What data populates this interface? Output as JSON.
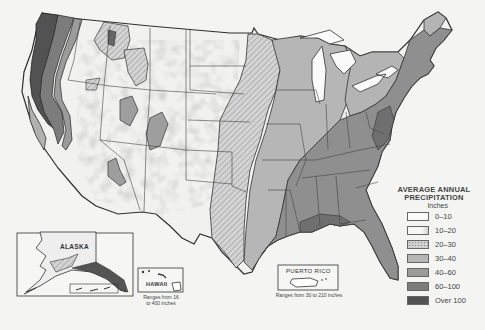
{
  "map": {
    "subject": "Average annual precipitation, United States",
    "legend": {
      "title_line1": "AVERAGE ANNUAL",
      "title_line2": "PRECIPITATION",
      "unit": "Inches",
      "items": [
        {
          "label": "0–10",
          "color": "#fbfbfb",
          "pattern": "plain"
        },
        {
          "label": "10–20",
          "color": "#f0f0f0",
          "pattern": "light-speckle"
        },
        {
          "label": "20–30",
          "color": "#c9c9c9",
          "pattern": "stipple"
        },
        {
          "label": "30–40",
          "color": "#b6b6b6",
          "pattern": "plain"
        },
        {
          "label": "40–60",
          "color": "#9b9b9b",
          "pattern": "plain"
        },
        {
          "label": "60–100",
          "color": "#7c7c7c",
          "pattern": "plain"
        },
        {
          "label": "Over 100",
          "color": "#525252",
          "pattern": "plain"
        }
      ]
    },
    "insets": {
      "alaska": {
        "label": "ALASKA"
      },
      "hawaii": {
        "label": "HAWAII",
        "note_line1": "Ranges from 16",
        "note_line2": "to 400 inches"
      },
      "puerto_rico": {
        "label": "PUERTO RICO",
        "note": "Ranges from 30 to 210 inches"
      }
    },
    "colors": {
      "background": "#f4f4f2",
      "border": "#333333"
    }
  }
}
